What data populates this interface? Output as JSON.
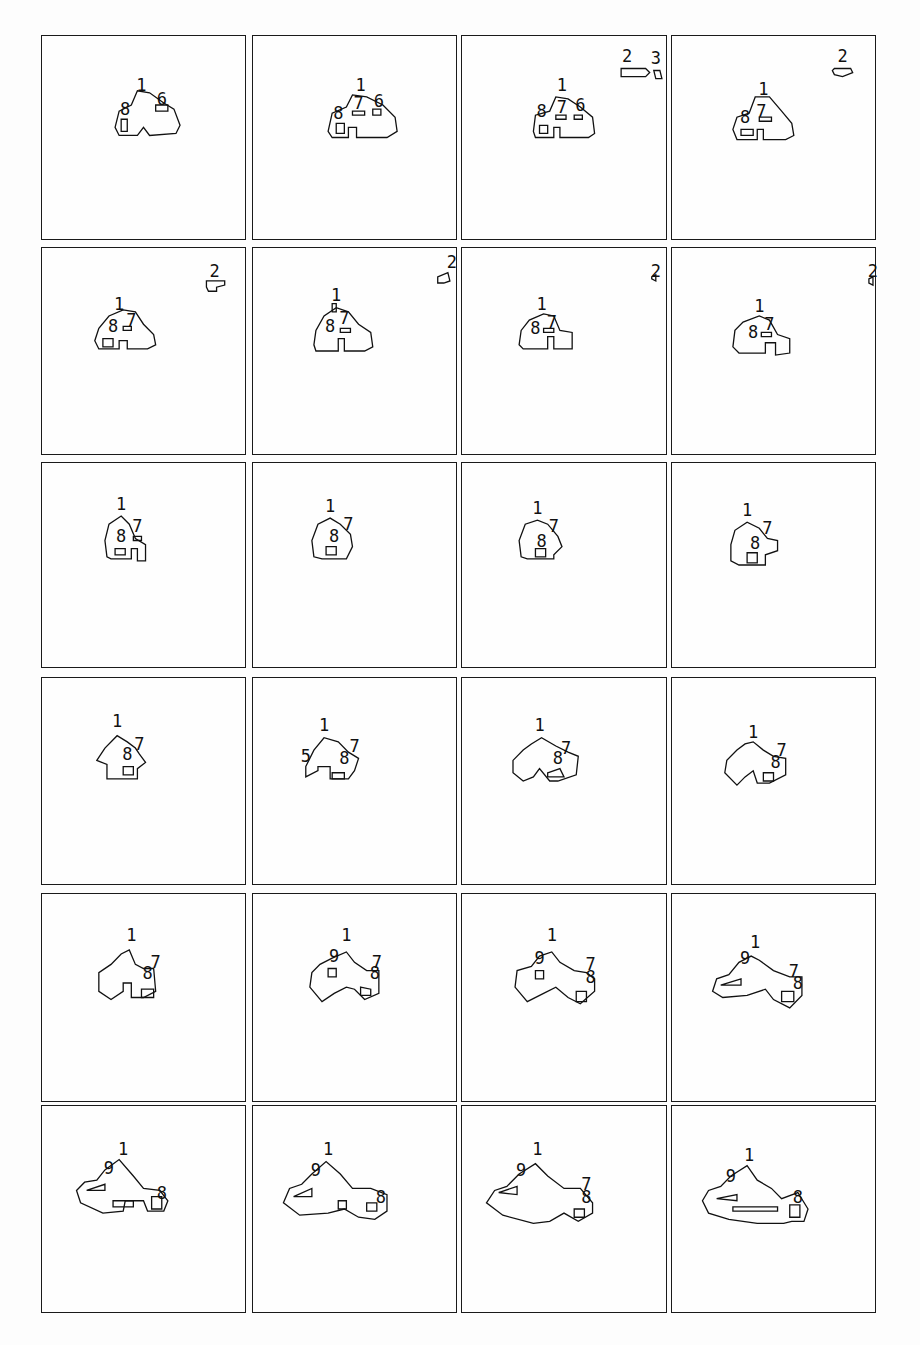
{
  "figure": {
    "layout": {
      "rows": 6,
      "cols": 4
    },
    "panels": [
      {
        "index": 1,
        "labels": [
          {
            "t": "1",
            "x": 0.49,
            "y": 0.24
          },
          {
            "t": "8",
            "x": 0.41,
            "y": 0.36
          },
          {
            "t": "6",
            "x": 0.59,
            "y": 0.31
          }
        ],
        "blobs": [
          "M0.36,0.45 L0.38,0.37 L0.44,0.34 L0.47,0.27 L0.53,0.28 L0.60,0.33 L0.65,0.36 L0.68,0.44 L0.66,0.48 L0.53,0.49 L0.50,0.45 L0.47,0.49 L0.38,0.49 Z",
          "M0.39,0.41 L0.42,0.41 L0.42,0.47 L0.39,0.47 Z",
          "M0.56,0.34 L0.62,0.34 L0.62,0.37 L0.56,0.37 Z"
        ],
        "satellites": []
      },
      {
        "index": 2,
        "labels": [
          {
            "t": "1",
            "x": 0.53,
            "y": 0.24
          },
          {
            "t": "8",
            "x": 0.42,
            "y": 0.38
          },
          {
            "t": "7",
            "x": 0.52,
            "y": 0.33
          },
          {
            "t": "6",
            "x": 0.62,
            "y": 0.32
          }
        ],
        "blobs": [
          "M0.37,0.47 L0.39,0.38 L0.46,0.35 L0.49,0.29 L0.56,0.30 L0.64,0.34 L0.70,0.40 L0.71,0.47 L0.66,0.50 L0.51,0.50 L0.51,0.45 L0.47,0.45 L0.47,0.50 L0.39,0.50 Z",
          "M0.41,0.43 L0.45,0.43 L0.45,0.48 L0.41,0.48 Z",
          "M0.49,0.37 L0.55,0.37 L0.55,0.39 L0.49,0.39 Z",
          "M0.59,0.36 L0.63,0.36 L0.63,0.39 L0.59,0.39 Z"
        ],
        "satellites": []
      },
      {
        "index": 3,
        "labels": [
          {
            "t": "1",
            "x": 0.49,
            "y": 0.24
          },
          {
            "t": "8",
            "x": 0.39,
            "y": 0.37
          },
          {
            "t": "7",
            "x": 0.49,
            "y": 0.35
          },
          {
            "t": "6",
            "x": 0.58,
            "y": 0.34
          },
          {
            "t": "2",
            "x": 0.81,
            "y": 0.1
          },
          {
            "t": "3",
            "x": 0.95,
            "y": 0.11
          }
        ],
        "blobs": [
          "M0.35,0.47 L0.36,0.39 L0.43,0.37 L0.46,0.30 L0.52,0.31 L0.58,0.35 L0.64,0.40 L0.65,0.48 L0.62,0.50 L0.48,0.50 L0.48,0.45 L0.45,0.45 L0.45,0.50 L0.36,0.50 Z",
          "M0.38,0.44 L0.42,0.44 L0.42,0.48 L0.38,0.48 Z",
          "M0.46,0.39 L0.51,0.39 L0.51,0.41 L0.46,0.41 Z",
          "M0.55,0.39 L0.59,0.39 L0.59,0.41 L0.55,0.41 Z"
        ],
        "satellites": [
          "M0.78,0.16 L0.90,0.16 L0.92,0.18 L0.90,0.20 L0.78,0.20 Z",
          "M0.94,0.17 L0.97,0.17 L0.98,0.21 L0.95,0.21 Z"
        ]
      },
      {
        "index": 4,
        "labels": [
          {
            "t": "1",
            "x": 0.45,
            "y": 0.26
          },
          {
            "t": "8",
            "x": 0.36,
            "y": 0.4
          },
          {
            "t": "7",
            "x": 0.44,
            "y": 0.37
          },
          {
            "t": "2",
            "x": 0.84,
            "y": 0.1
          }
        ],
        "blobs": [
          "M0.30,0.46 L0.32,0.40 L0.38,0.38 L0.41,0.30 L0.48,0.30 L0.54,0.37 L0.59,0.43 L0.60,0.49 L0.56,0.51 L0.45,0.51 L0.45,0.46 L0.42,0.46 L0.42,0.51 L0.32,0.51 Z",
          "M0.34,0.46 L0.40,0.46 L0.40,0.49 L0.34,0.49 Z",
          "M0.43,0.40 L0.49,0.40 L0.49,0.42 L0.43,0.42 Z"
        ],
        "satellites": [
          "M0.80,0.16 L0.88,0.16 L0.89,0.18 L0.84,0.20 L0.80,0.19 L0.79,0.17 Z"
        ]
      },
      {
        "index": 5,
        "labels": [
          {
            "t": "1",
            "x": 0.38,
            "y": 0.27
          },
          {
            "t": "8",
            "x": 0.35,
            "y": 0.38
          },
          {
            "t": "7",
            "x": 0.44,
            "y": 0.35
          },
          {
            "t": "2",
            "x": 0.85,
            "y": 0.11
          }
        ],
        "blobs": [
          "M0.26,0.45 L0.28,0.39 L0.33,0.33 L0.40,0.30 L0.46,0.31 L0.50,0.37 L0.55,0.42 L0.56,0.47 L0.52,0.49 L0.42,0.49 L0.42,0.45 L0.38,0.45 L0.38,0.49 L0.28,0.49 Z",
          "M0.30,0.44 L0.35,0.44 L0.35,0.48 L0.30,0.48 Z",
          "M0.40,0.38 L0.44,0.38 L0.44,0.40 L0.40,0.40 Z"
        ],
        "satellites": [
          "M0.81,0.16 L0.90,0.16 L0.90,0.18 L0.86,0.19 L0.86,0.21 L0.82,0.21 L0.81,0.19 Z"
        ]
      },
      {
        "index": 6,
        "labels": [
          {
            "t": "1",
            "x": 0.41,
            "y": 0.23
          },
          {
            "t": "8",
            "x": 0.38,
            "y": 0.38
          },
          {
            "t": "7",
            "x": 0.45,
            "y": 0.34
          },
          {
            "t": "2",
            "x": 0.98,
            "y": 0.07
          }
        ],
        "blobs": [
          "M0.30,0.47 L0.31,0.40 L0.35,0.33 L0.41,0.29 L0.47,0.31 L0.52,0.37 L0.58,0.41 L0.59,0.48 L0.55,0.50 L0.45,0.50 L0.45,0.44 L0.42,0.44 L0.42,0.50 L0.31,0.50 Z",
          "M0.39,0.27 L0.41,0.27 L0.41,0.31 L0.39,0.31 Z",
          "M0.43,0.39 L0.48,0.39 L0.48,0.41 L0.43,0.41 Z"
        ],
        "satellites": [
          "M0.91,0.14 L0.96,0.12 L0.97,0.16 L0.94,0.17 L0.91,0.17 Z"
        ]
      },
      {
        "index": 7,
        "labels": [
          {
            "t": "1",
            "x": 0.39,
            "y": 0.27
          },
          {
            "t": "8",
            "x": 0.36,
            "y": 0.39
          },
          {
            "t": "7",
            "x": 0.44,
            "y": 0.36
          },
          {
            "t": "2",
            "x": 0.95,
            "y": 0.11
          }
        ],
        "blobs": [
          "M0.28,0.47 L0.29,0.40 L0.33,0.35 L0.40,0.32 L0.45,0.33 L0.48,0.40 L0.54,0.41 L0.54,0.49 L0.45,0.49 L0.45,0.43 L0.42,0.43 L0.42,0.49 L0.30,0.49 Z",
          "M0.40,0.39 L0.45,0.39 L0.45,0.41 L0.40,0.41 Z"
        ],
        "satellites": [
          "M0.93,0.14 L0.95,0.13 L0.95,0.16 L0.93,0.15 Z"
        ]
      },
      {
        "index": 8,
        "labels": [
          {
            "t": "1",
            "x": 0.43,
            "y": 0.28
          },
          {
            "t": "8",
            "x": 0.4,
            "y": 0.41
          },
          {
            "t": "7",
            "x": 0.48,
            "y": 0.37
          },
          {
            "t": "2",
            "x": 0.99,
            "y": 0.11
          }
        ],
        "blobs": [
          "M0.30,0.48 L0.31,0.40 L0.35,0.36 L0.43,0.33 L0.48,0.35 L0.52,0.42 L0.58,0.44 L0.58,0.51 L0.51,0.52 L0.51,0.46 L0.46,0.46 L0.46,0.51 L0.33,0.51 Z",
          "M0.44,0.41 L0.49,0.41 L0.49,0.43 L0.44,0.43 Z"
        ],
        "satellites": [
          "M0.97,0.15 L0.99,0.14 L0.99,0.18 L0.97,0.17 Z"
        ]
      },
      {
        "index": 9,
        "labels": [
          {
            "t": "1",
            "x": 0.39,
            "y": 0.2
          },
          {
            "t": "8",
            "x": 0.39,
            "y": 0.36
          },
          {
            "t": "7",
            "x": 0.47,
            "y": 0.31
          }
        ],
        "blobs": [
          "M0.32,0.46 L0.31,0.38 L0.33,0.30 L0.39,0.26 L0.43,0.30 L0.46,0.37 L0.51,0.40 L0.51,0.48 L0.47,0.48 L0.47,0.42 L0.44,0.42 L0.44,0.47 L0.34,0.47 Z",
          "M0.45,0.36 L0.49,0.36 L0.49,0.38 L0.45,0.38 Z",
          "M0.36,0.42 L0.41,0.42 L0.41,0.45 L0.36,0.45 Z"
        ],
        "satellites": []
      },
      {
        "index": 10,
        "labels": [
          {
            "t": "1",
            "x": 0.38,
            "y": 0.21
          },
          {
            "t": "8",
            "x": 0.4,
            "y": 0.36
          },
          {
            "t": "7",
            "x": 0.47,
            "y": 0.3
          }
        ],
        "blobs": [
          "M0.30,0.46 L0.29,0.38 L0.32,0.30 L0.38,0.27 L0.43,0.30 L0.48,0.35 L0.49,0.41 L0.46,0.47 L0.34,0.47 Z",
          "M0.36,0.41 L0.41,0.41 L0.41,0.45 L0.36,0.45 Z"
        ],
        "satellites": []
      },
      {
        "index": 11,
        "labels": [
          {
            "t": "1",
            "x": 0.37,
            "y": 0.22
          },
          {
            "t": "8",
            "x": 0.39,
            "y": 0.38
          },
          {
            "t": "7",
            "x": 0.45,
            "y": 0.31
          }
        ],
        "blobs": [
          "M0.29,0.46 L0.28,0.38 L0.31,0.30 L0.37,0.28 L0.42,0.30 L0.47,0.36 L0.49,0.41 L0.45,0.45 L0.45,0.47 L0.32,0.47 Z",
          "M0.36,0.42 L0.41,0.42 L0.41,0.46 L0.36,0.46 Z"
        ],
        "satellites": []
      },
      {
        "index": 12,
        "labels": [
          {
            "t": "1",
            "x": 0.37,
            "y": 0.23
          },
          {
            "t": "8",
            "x": 0.41,
            "y": 0.39
          },
          {
            "t": "7",
            "x": 0.47,
            "y": 0.32
          }
        ],
        "blobs": [
          "M0.29,0.48 L0.29,0.40 L0.31,0.33 L0.37,0.29 L0.43,0.32 L0.47,0.37 L0.52,0.38 L0.52,0.43 L0.46,0.45 L0.46,0.50 L0.33,0.50 Z",
          "M0.37,0.44 L0.42,0.44 L0.42,0.49 L0.37,0.49 Z"
        ],
        "satellites": []
      },
      {
        "index": 13,
        "labels": [
          {
            "t": "1",
            "x": 0.37,
            "y": 0.21
          },
          {
            "t": "8",
            "x": 0.42,
            "y": 0.37
          },
          {
            "t": "7",
            "x": 0.48,
            "y": 0.32
          }
        ],
        "blobs": [
          "M0.27,0.40 L0.31,0.34 L0.37,0.28 L0.42,0.31 L0.46,0.34 L0.48,0.37 L0.51,0.41 L0.47,0.44 L0.47,0.49 L0.32,0.49 L0.32,0.42 Z",
          "M0.40,0.43 L0.45,0.43 L0.45,0.47 L0.40,0.47 Z"
        ],
        "satellites": []
      },
      {
        "index": 14,
        "labels": [
          {
            "t": "1",
            "x": 0.35,
            "y": 0.23
          },
          {
            "t": "5",
            "x": 0.26,
            "y": 0.38
          },
          {
            "t": "8",
            "x": 0.45,
            "y": 0.39
          },
          {
            "t": "7",
            "x": 0.5,
            "y": 0.33
          }
        ],
        "blobs": [
          "M0.26,0.43 L0.30,0.35 L0.35,0.29 L0.42,0.31 L0.47,0.36 L0.52,0.39 L0.50,0.45 L0.47,0.49 L0.38,0.49 L0.38,0.43 L0.32,0.43 L0.32,0.45 L0.26,0.48 Z",
          "M0.39,0.46 L0.45,0.46 L0.45,0.49 L0.39,0.49 Z"
        ],
        "satellites": []
      },
      {
        "index": 15,
        "labels": [
          {
            "t": "1",
            "x": 0.38,
            "y": 0.23
          },
          {
            "t": "8",
            "x": 0.47,
            "y": 0.39
          },
          {
            "t": "7",
            "x": 0.51,
            "y": 0.34
          }
        ],
        "blobs": [
          "M0.25,0.46 L0.25,0.40 L0.30,0.35 L0.34,0.32 L0.39,0.29 L0.46,0.33 L0.52,0.36 L0.57,0.38 L0.56,0.47 L0.47,0.50 L0.43,0.50 L0.38,0.44 L0.35,0.48 L0.30,0.50 Z",
          "M0.42,0.46 L0.48,0.44 L0.50,0.48 L0.42,0.48 Z"
        ],
        "satellites": []
      },
      {
        "index": 16,
        "labels": [
          {
            "t": "1",
            "x": 0.4,
            "y": 0.26
          },
          {
            "t": "8",
            "x": 0.51,
            "y": 0.41
          },
          {
            "t": "7",
            "x": 0.54,
            "y": 0.35
          }
        ],
        "blobs": [
          "M0.26,0.46 L0.27,0.40 L0.32,0.35 L0.36,0.32 L0.40,0.31 L0.45,0.35 L0.50,0.38 L0.56,0.39 L0.56,0.47 L0.48,0.51 L0.42,0.51 L0.40,0.45 L0.36,0.48 L0.32,0.52 Z",
          "M0.45,0.46 L0.50,0.46 L0.50,0.50 L0.45,0.50 Z"
        ],
        "satellites": []
      },
      {
        "index": 17,
        "labels": [
          {
            "t": "1",
            "x": 0.44,
            "y": 0.2
          },
          {
            "t": "8",
            "x": 0.52,
            "y": 0.38
          },
          {
            "t": "7",
            "x": 0.56,
            "y": 0.33
          }
        ],
        "blobs": [
          "M0.28,0.47 L0.28,0.38 L0.34,0.34 L0.39,0.29 L0.43,0.27 L0.46,0.34 L0.50,0.36 L0.55,0.36 L0.56,0.47 L0.50,0.50 L0.44,0.50 L0.44,0.43 L0.40,0.43 L0.40,0.47 L0.34,0.51 Z",
          "M0.49,0.46 L0.55,0.46 L0.55,0.50 L0.49,0.50 Z"
        ],
        "satellites": []
      },
      {
        "index": 18,
        "labels": [
          {
            "t": "1",
            "x": 0.46,
            "y": 0.2
          },
          {
            "t": "9",
            "x": 0.4,
            "y": 0.3
          },
          {
            "t": "8",
            "x": 0.6,
            "y": 0.38
          },
          {
            "t": "7",
            "x": 0.61,
            "y": 0.33
          }
        ],
        "blobs": [
          "M0.28,0.45 L0.29,0.38 L0.33,0.34 L0.39,0.31 L0.46,0.28 L0.50,0.33 L0.56,0.37 L0.62,0.37 L0.62,0.48 L0.55,0.51 L0.50,0.46 L0.46,0.45 L0.40,0.48 L0.34,0.52 Z",
          "M0.37,0.36 L0.41,0.36 L0.41,0.40 L0.37,0.40 Z",
          "M0.53,0.45 L0.58,0.46 L0.58,0.49 L0.53,0.49 Z"
        ],
        "satellites": []
      },
      {
        "index": 19,
        "labels": [
          {
            "t": "1",
            "x": 0.44,
            "y": 0.2
          },
          {
            "t": "9",
            "x": 0.38,
            "y": 0.31
          },
          {
            "t": "8",
            "x": 0.63,
            "y": 0.4
          },
          {
            "t": "7",
            "x": 0.63,
            "y": 0.34
          }
        ],
        "blobs": [
          "M0.26,0.45 L0.27,0.37 L0.34,0.35 L0.38,0.30 L0.44,0.28 L0.48,0.33 L0.55,0.37 L0.61,0.38 L0.65,0.41 L0.65,0.47 L0.58,0.53 L0.52,0.50 L0.46,0.45 L0.40,0.48 L0.32,0.52 Z",
          "M0.36,0.37 L0.40,0.37 L0.40,0.41 L0.36,0.41 Z",
          "M0.56,0.47 L0.61,0.47 L0.61,0.52 L0.56,0.52 Z"
        ],
        "satellites": []
      },
      {
        "index": 20,
        "labels": [
          {
            "t": "1",
            "x": 0.41,
            "y": 0.23
          },
          {
            "t": "9",
            "x": 0.36,
            "y": 0.31
          },
          {
            "t": "8",
            "x": 0.62,
            "y": 0.43
          },
          {
            "t": "7",
            "x": 0.6,
            "y": 0.37
          }
        ],
        "blobs": [
          "M0.20,0.47 L0.22,0.41 L0.28,0.39 L0.33,0.33 L0.39,0.30 L0.43,0.32 L0.50,0.37 L0.58,0.40 L0.64,0.40 L0.64,0.49 L0.58,0.55 L0.50,0.51 L0.46,0.46 L0.37,0.49 L0.25,0.50 Z",
          "M0.24,0.44 L0.34,0.41 L0.34,0.44 Z",
          "M0.54,0.47 L0.60,0.47 L0.60,0.52 L0.54,0.52 Z"
        ],
        "satellites": []
      },
      {
        "index": 21,
        "labels": [
          {
            "t": "1",
            "x": 0.4,
            "y": 0.21
          },
          {
            "t": "9",
            "x": 0.33,
            "y": 0.3
          },
          {
            "t": "8",
            "x": 0.59,
            "y": 0.42
          }
        ],
        "blobs": [
          "M0.17,0.41 L0.21,0.37 L0.27,0.36 L0.31,0.31 L0.38,0.26 L0.45,0.34 L0.50,0.40 L0.58,0.41 L0.62,0.46 L0.60,0.51 L0.52,0.51 L0.50,0.46 L0.41,0.46 L0.40,0.51 L0.30,0.52 L0.19,0.47 Z",
          "M0.22,0.41 L0.31,0.38 L0.31,0.41 Z",
          "M0.54,0.44 L0.59,0.44 L0.59,0.50 L0.54,0.50 Z",
          "M0.35,0.46 L0.45,0.46 L0.45,0.49 L0.35,0.49 Z"
        ],
        "satellites": []
      },
      {
        "index": 22,
        "labels": [
          {
            "t": "1",
            "x": 0.37,
            "y": 0.21
          },
          {
            "t": "9",
            "x": 0.31,
            "y": 0.31
          },
          {
            "t": "8",
            "x": 0.63,
            "y": 0.44
          }
        ],
        "blobs": [
          "M0.15,0.47 L0.18,0.40 L0.24,0.38 L0.29,0.33 L0.36,0.27 L0.43,0.33 L0.49,0.40 L0.58,0.40 L0.66,0.43 L0.66,0.51 L0.60,0.55 L0.52,0.54 L0.45,0.50 L0.37,0.52 L0.23,0.53 Z",
          "M0.20,0.44 L0.29,0.40 L0.29,0.44 Z",
          "M0.56,0.47 L0.61,0.47 L0.61,0.51 L0.56,0.51 Z",
          "M0.42,0.46 L0.46,0.46 L0.46,0.50 L0.42,0.50 Z"
        ],
        "satellites": []
      },
      {
        "index": 23,
        "labels": [
          {
            "t": "1",
            "x": 0.37,
            "y": 0.21
          },
          {
            "t": "9",
            "x": 0.29,
            "y": 0.31
          },
          {
            "t": "8",
            "x": 0.61,
            "y": 0.44
          },
          {
            "t": "7",
            "x": 0.61,
            "y": 0.38
          }
        ],
        "blobs": [
          "M0.12,0.47 L0.16,0.41 L0.22,0.39 L0.28,0.33 L0.36,0.28 L0.42,0.34 L0.50,0.40 L0.58,0.40 L0.64,0.47 L0.64,0.52 L0.57,0.56 L0.50,0.52 L0.43,0.56 L0.35,0.57 L0.20,0.53 Z",
          "M0.18,0.42 L0.27,0.39 L0.27,0.43 Z",
          "M0.55,0.50 L0.60,0.50 L0.60,0.54 L0.55,0.54 Z"
        ],
        "satellites": []
      },
      {
        "index": 24,
        "labels": [
          {
            "t": "1",
            "x": 0.38,
            "y": 0.24
          },
          {
            "t": "9",
            "x": 0.29,
            "y": 0.34
          },
          {
            "t": "8",
            "x": 0.62,
            "y": 0.44
          }
        ],
        "blobs": [
          "M0.15,0.46 L0.18,0.41 L0.24,0.39 L0.29,0.34 L0.37,0.29 L0.42,0.36 L0.49,0.40 L0.54,0.45 L0.62,0.42 L0.67,0.50 L0.65,0.56 L0.59,0.56 L0.55,0.57 L0.42,0.57 L0.28,0.55 L0.18,0.52 Z",
          "M0.22,0.45 L0.32,0.43 L0.32,0.46 Z",
          "M0.30,0.49 L0.52,0.49 L0.52,0.51 L0.30,0.51 Z",
          "M0.58,0.48 L0.63,0.48 L0.63,0.54 L0.58,0.54 Z"
        ],
        "satellites": []
      }
    ]
  }
}
